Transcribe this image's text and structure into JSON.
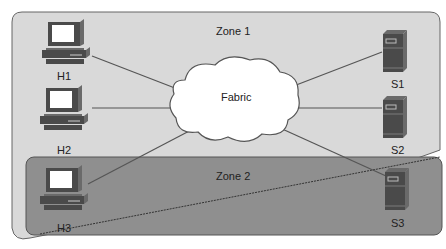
{
  "diagram": {
    "zones": [
      {
        "id": "zone1",
        "label": "Zone 1"
      },
      {
        "id": "zone2",
        "label": "Zone 2"
      }
    ],
    "fabric": {
      "label": "Fabric"
    },
    "hosts": [
      {
        "id": "H1",
        "label": "H1"
      },
      {
        "id": "H2",
        "label": "H2"
      },
      {
        "id": "H3",
        "label": "H3"
      }
    ],
    "servers": [
      {
        "id": "S1",
        "label": "S1"
      },
      {
        "id": "S2",
        "label": "S2"
      },
      {
        "id": "S3",
        "label": "S3"
      }
    ],
    "links": [
      [
        "H1",
        "Fabric"
      ],
      [
        "H2",
        "Fabric"
      ],
      [
        "H3",
        "Fabric"
      ],
      [
        "S1",
        "Fabric"
      ],
      [
        "S2",
        "Fabric"
      ],
      [
        "S3",
        "Fabric"
      ]
    ],
    "colors": {
      "zone1_fill": "#d9d9d9",
      "zone2_fill": "#8c8c8c",
      "border": "#555555",
      "cloud_fill": "#ffffff",
      "device_dark": "#4a4a4a",
      "device_light": "#ffffff"
    }
  }
}
